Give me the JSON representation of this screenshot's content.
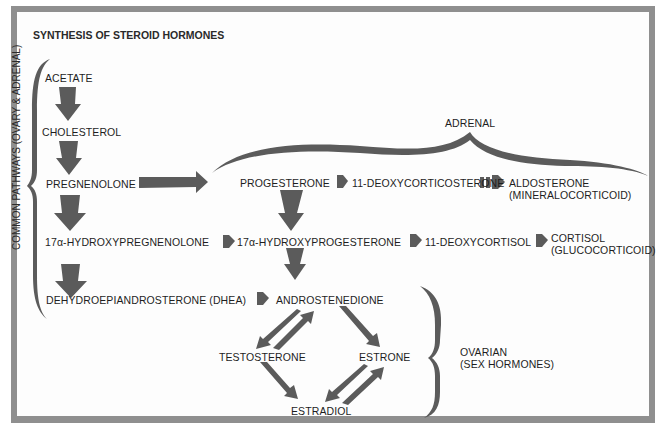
{
  "title": "SYNTHESIS OF STEROID HORMONES",
  "groups": {
    "common": "COMMON PATHWAYS (OVARY & ADRENAL)",
    "adrenal": "ADRENAL",
    "ovarian_line1": "OVARIAN",
    "ovarian_line2": "(SEX HORMONES)"
  },
  "nodes": {
    "acetate": "ACETATE",
    "cholesterol": "CHOLESTEROL",
    "pregnenolone": "PREGNENOLONE",
    "hydroxypregnenolone": "17α-HYDROXYPREGNENOLONE",
    "dhea": "DEHYDROEPIANDROSTERONE (DHEA)",
    "progesterone": "PROGESTERONE",
    "deoxycorticosterone": "11-DEOXYCORTICOSTERONE",
    "aldosterone": "ALDOSTERONE",
    "aldosterone_note": "(MINERALOCORTICOID)",
    "hydroxyprogesterone": "17α-HYDROXYPROGESTERONE",
    "deoxycortisol": "11-DEOXYCORTISOL",
    "cortisol": "CORTISOL",
    "cortisol_note": "(GLUCOCORTICOID)",
    "androstenedione": "ANDROSTENEDIONE",
    "testosterone": "TESTOSTERONE",
    "estrone": "ESTRONE",
    "estradiol": "ESTRADIOL"
  },
  "edges": [
    {
      "from": "acetate",
      "to": "cholesterol"
    },
    {
      "from": "cholesterol",
      "to": "pregnenolone"
    },
    {
      "from": "pregnenolone",
      "to": "hydroxypregnenolone"
    },
    {
      "from": "hydroxypregnenolone",
      "to": "dhea"
    },
    {
      "from": "pregnenolone",
      "to": "progesterone"
    },
    {
      "from": "progesterone",
      "to": "deoxycorticosterone"
    },
    {
      "from": "deoxycorticosterone",
      "to": "aldosterone"
    },
    {
      "from": "progesterone",
      "to": "hydroxyprogesterone"
    },
    {
      "from": "hydroxypregnenolone",
      "to": "hydroxyprogesterone"
    },
    {
      "from": "hydroxyprogesterone",
      "to": "deoxycortisol"
    },
    {
      "from": "deoxycortisol",
      "to": "cortisol"
    },
    {
      "from": "hydroxyprogesterone",
      "to": "androstenedione"
    },
    {
      "from": "dhea",
      "to": "androstenedione"
    },
    {
      "from": "androstenedione",
      "to": "testosterone",
      "bidirectional": true
    },
    {
      "from": "androstenedione",
      "to": "estrone"
    },
    {
      "from": "testosterone",
      "to": "estradiol"
    },
    {
      "from": "estrone",
      "to": "estradiol",
      "bidirectional": true
    }
  ],
  "colors": {
    "frame": "#8f8f8f",
    "arrow": "#5b5b5b",
    "text": "#1e1e1e"
  }
}
